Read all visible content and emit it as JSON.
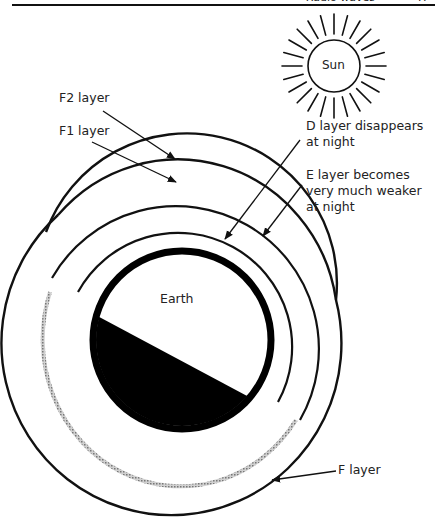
{
  "header": {
    "running_title": "Radio waves",
    "page_number": "47"
  },
  "diagram": {
    "sun_label": "Sun",
    "earth_label": "Earth",
    "labels": {
      "f2": "F2 layer",
      "f1": "F1 layer",
      "d_line1": "D layer disappears",
      "d_line2": "at night",
      "e_line1": "E layer becomes",
      "e_line2": "very much weaker",
      "e_line3": "at night",
      "f": "F layer"
    },
    "colors": {
      "line": "#111111",
      "night_layer": "#a8a8a8",
      "earth_night": "#000000",
      "background": "#ffffff"
    }
  }
}
